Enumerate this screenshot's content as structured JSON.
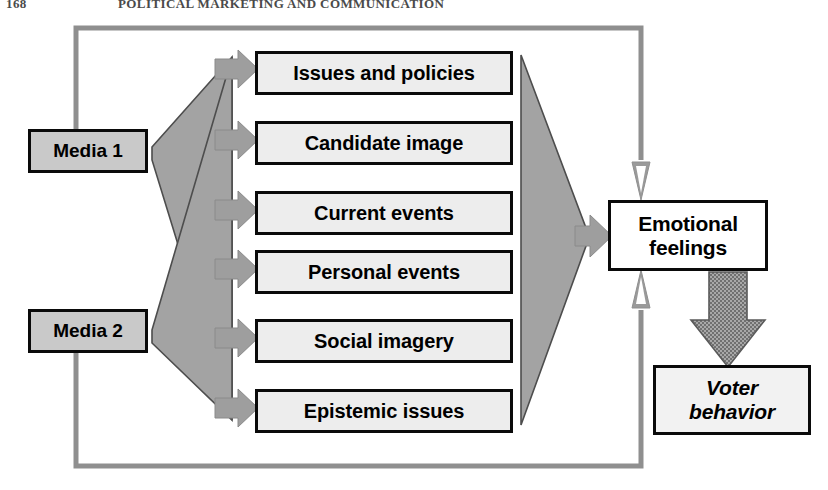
{
  "page": {
    "width": 828,
    "height": 490,
    "background": "#ffffff",
    "header_page_number": "168",
    "header_title": "POLITICAL MARKETING AND COMMUNICATION"
  },
  "colors": {
    "box_fill": "#ededed",
    "box_border": "#0a0a0a",
    "media_fill": "#c9c9c9",
    "emotion_fill": "#ffffff",
    "voter_fill": "#f2f2f2",
    "fan_fill": "#a0a0a0",
    "fan_stroke": "#4d4d4d",
    "arrow_fill": "#9a9a9a",
    "feedback_line": "#8c8c8c",
    "thick_arrow_fill": "#9c9c9c"
  },
  "diagram": {
    "sources": [
      {
        "id": "media-1",
        "label": "Media 1"
      },
      {
        "id": "media-2",
        "label": "Media 2"
      }
    ],
    "attributes": [
      {
        "id": "issues-and-policies",
        "label": "Issues and policies"
      },
      {
        "id": "candidate-image",
        "label": "Candidate image"
      },
      {
        "id": "current-events",
        "label": "Current events"
      },
      {
        "id": "personal-events",
        "label": "Personal events"
      },
      {
        "id": "social-imagery",
        "label": "Social imagery"
      },
      {
        "id": "epistemic-issues",
        "label": "Epistemic issues"
      }
    ],
    "outcomes": [
      {
        "id": "emotional-feelings",
        "label": "Emotional feelings",
        "line1": "Emotional",
        "line2": "feelings"
      },
      {
        "id": "voter-behavior",
        "label": "Voter behavior",
        "line1": "Voter",
        "line2": "behavior"
      }
    ],
    "connectors": [
      {
        "id": "media1-fan",
        "from": "Media 1",
        "to": "attributes",
        "style": "gray-fan"
      },
      {
        "id": "media2-fan",
        "from": "Media 2",
        "to": "attributes",
        "style": "gray-fan"
      },
      {
        "id": "attributes-converge",
        "from": "attributes",
        "to": "Emotional feelings",
        "style": "gray-converging-triangle"
      },
      {
        "id": "emotion-to-voter",
        "from": "Emotional feelings",
        "to": "Voter behavior",
        "style": "thick-textured-down-arrow"
      },
      {
        "id": "feedback-top",
        "from": "Emotional feelings",
        "to": "Media 1",
        "style": "gray-feedback-loop"
      },
      {
        "id": "feedback-bottom",
        "from": "Emotional feelings",
        "to": "Media 2",
        "style": "gray-feedback-loop"
      }
    ]
  }
}
